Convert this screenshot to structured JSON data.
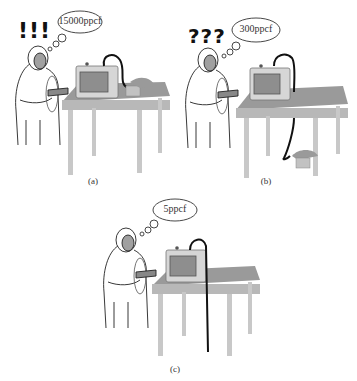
{
  "figure": {
    "panels": [
      {
        "id": "a",
        "caption": "(a)",
        "exclamation": "!!!",
        "thought": "15000ppcf",
        "hose_state": "coiled-on-table"
      },
      {
        "id": "b",
        "caption": "(b)",
        "exclamation": "???",
        "thought": "300ppcf",
        "hose_state": "coiled-on-floor"
      },
      {
        "id": "c",
        "caption": "(c)",
        "exclamation": "",
        "thought": "5ppcf",
        "hose_state": "straight-to-floor"
      }
    ],
    "colors": {
      "table_top": "#9a9a9a",
      "table_edge": "#b8b8b8",
      "legs": "#c8c8c8",
      "monitor": "#d6d6d6",
      "screen": "#8e8e8e",
      "hose": "#111111",
      "suit": "#ffffff",
      "face": "#a0a0a0"
    }
  }
}
